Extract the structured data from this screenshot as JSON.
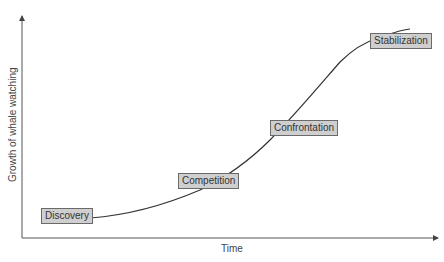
{
  "diagram": {
    "type": "growth-curve",
    "x_axis_label": "Time",
    "y_axis_label": "Growth of whale  watching",
    "stages": [
      {
        "label": "Discovery"
      },
      {
        "label": "Competition"
      },
      {
        "label": "Confrontation"
      },
      {
        "label": "Stabilization"
      }
    ],
    "colors": {
      "axis": "#555555",
      "curve": "#333333",
      "label_fill": "#cfcfcf",
      "label_border": "#6a6a6a"
    }
  }
}
